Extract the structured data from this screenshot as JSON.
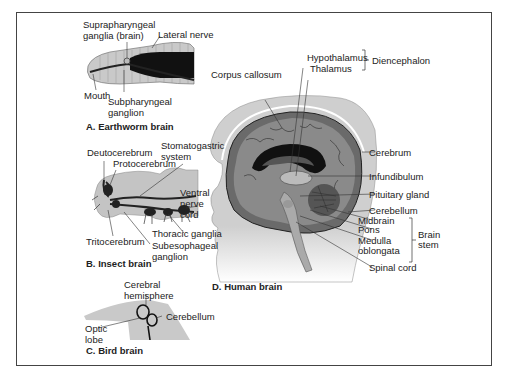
{
  "figure": {
    "panels": [
      {
        "caption": "A. Earthworm brain",
        "labels": {
          "suprapharyngeal_1": "Suprapharyngeal",
          "suprapharyngeal_2": "ganglia (brain)",
          "lateral_nerve": "Lateral nerve",
          "mouth": "Mouth",
          "subpharyngeal_1": "Subpharyngeal",
          "subpharyngeal_2": "ganglion"
        }
      },
      {
        "caption": "B. Insect brain",
        "labels": {
          "deutocerebrum": "Deutocerebrum",
          "protocerebrum": "Protocerebrum",
          "stomatogastric_1": "Stomatogastric",
          "stomatogastric_2": "system",
          "ventral_1": "Ventral",
          "ventral_2": "nerve",
          "ventral_3": "cord",
          "thoracic": "Thoracic ganglia",
          "tritocerebrum": "Tritocerebrum",
          "subesophageal_1": "Subesophageal",
          "subesophageal_2": "ganglion"
        }
      },
      {
        "caption": "C. Bird brain",
        "labels": {
          "cerebral_1": "Cerebral",
          "cerebral_2": "hemisphere",
          "cerebellum": "Cerebellum",
          "optic_1": "Optic",
          "optic_2": "lobe"
        }
      },
      {
        "caption": "D. Human brain",
        "labels": {
          "corpus_callosum": "Corpus callosum",
          "hypothalamus": "Hypothalamus",
          "thalamus": "Thalamus",
          "diencephalon": "Diencephalon",
          "cerebrum": "Cerebrum",
          "infundibulum": "Infundibulum",
          "pituitary": "Pituitary gland",
          "cerebellum": "Cerebellum",
          "midbrain": "Midbrain",
          "pons": "Pons",
          "medulla_1": "Medulla",
          "medulla_2": "oblongata",
          "brain_stem_1": "Brain",
          "brain_stem_2": "stem",
          "spinal_cord": "Spinal cord"
        }
      }
    ]
  }
}
